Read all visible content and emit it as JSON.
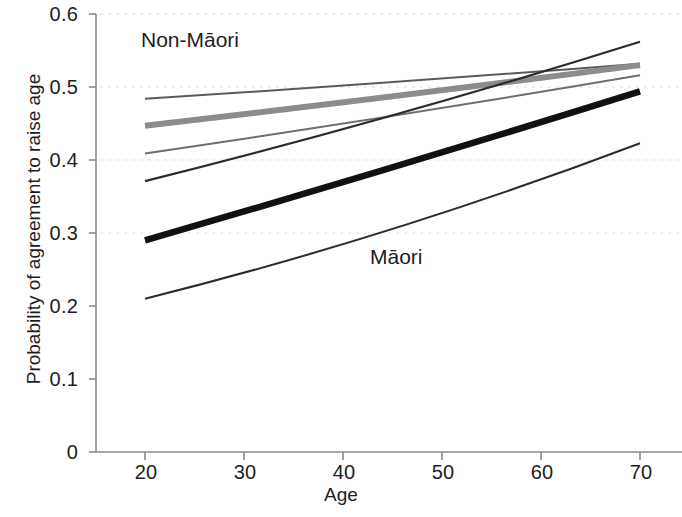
{
  "chart_data": {
    "type": "line",
    "title": "",
    "xlabel": "Age",
    "ylabel": "Probability of agreement to raise age",
    "xlim": [
      20,
      70
    ],
    "ylim": [
      0,
      0.6
    ],
    "grid": false,
    "legend": "none",
    "x_ticks": [
      "20",
      "30",
      "40",
      "50",
      "60",
      "70"
    ],
    "x_tick_values": [
      20,
      30,
      40,
      50,
      60,
      70
    ],
    "y_ticks": [
      "0",
      "0.1",
      "0.2",
      "0.3",
      "0.4",
      "0.5",
      "0.6"
    ],
    "y_tick_values": [
      0,
      0.1,
      0.2,
      0.3,
      0.4,
      0.5,
      0.6
    ],
    "annotations": [
      {
        "text": "Non-Māori",
        "x": 24,
        "y": 0.565
      },
      {
        "text": "Māori",
        "x": 46,
        "y": 0.275
      }
    ],
    "x": [
      20,
      70
    ],
    "series": [
      {
        "name": "non-maori-thin-upper",
        "group": "Non-Māori",
        "values": [
          0.484,
          0.532
        ],
        "color": "#5a5a5a",
        "width": 2.0
      },
      {
        "name": "non-maori-thick-grey",
        "group": "Non-Māori",
        "values": [
          0.447,
          0.53
        ],
        "color": "#8c8c8c",
        "width": 6.0
      },
      {
        "name": "non-maori-thin-lower",
        "group": "Non-Māori",
        "values": [
          0.409,
          0.516
        ],
        "color": "#6e6e6e",
        "width": 2.0
      },
      {
        "name": "maori-thin-upper",
        "group": "Māori",
        "values": [
          0.371,
          0.562
        ],
        "color": "#2b2b2b",
        "width": 2.2
      },
      {
        "name": "maori-thick-black",
        "group": "Māori",
        "values": [
          0.29,
          0.494
        ],
        "color": "#111111",
        "width": 6.5
      },
      {
        "name": "maori-thin-lower",
        "group": "Māori",
        "values": [
          0.21,
          0.423
        ],
        "color": "#2b2b2b",
        "width": 2.0
      }
    ]
  }
}
